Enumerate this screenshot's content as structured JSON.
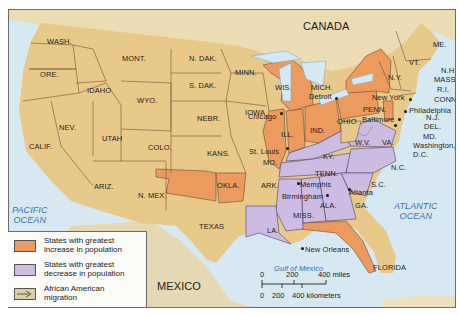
{
  "colors": {
    "water": "#d6e9f3",
    "land_neutral": "#e9c98a",
    "land_foreign": "#ecdcb4",
    "increase": "#ec9a5e",
    "decrease": "#cdbbe3",
    "border": "#5a4a3a",
    "ocean_label": "#3a6fae"
  },
  "regions": {
    "canada": "CANADA",
    "mexico": "MEXICO",
    "pacific": "PACIFIC\nOCEAN",
    "atlantic": "ATLANTIC\nOCEAN",
    "gulf": "Gulf of Mexico"
  },
  "states": {
    "wash": "WASH.",
    "ore": "ORE.",
    "calif": "CALIF.",
    "idaho": "IDAHO",
    "nev": "NEV.",
    "mont": "MONT.",
    "wyo": "WYO.",
    "utah": "UTAH",
    "ariz": "ARIZ.",
    "colo": "COLO.",
    "nmex": "N. MEX.",
    "ndak": "N. DAK.",
    "sdak": "S. DAK.",
    "nebr": "NEBR.",
    "kans": "KANS.",
    "okla": "OKLA.",
    "texas": "TEXAS",
    "minn": "MINN.",
    "iowa": "IOWA",
    "mo": "MO.",
    "ark": "ARK.",
    "la": "LA.",
    "wis": "WIS.",
    "ill": "ILL.",
    "mich": "MICH.",
    "ind": "IND.",
    "ohio": "OHIO",
    "ky": "KY.",
    "tenn": "TENN.",
    "miss": "MISS.",
    "ala": "ALA.",
    "ga": "GA.",
    "florida": "FLORIDA",
    "sc": "S.C.",
    "nc": "N.C.",
    "va": "VA.",
    "wv": "W.V.",
    "penn": "PENN.",
    "ny": "N.Y.",
    "vt": "VT.",
    "me": "ME.",
    "nh": "N.H.",
    "mass": "MASS.",
    "ri": "R.I.",
    "conn": "CONN.",
    "nj": "N.J.",
    "del": "DEL.",
    "md": "MD.",
    "dc": "Washington,\nD.C."
  },
  "cities": {
    "chicago": "Chicago",
    "detroit": "Detroit",
    "st_louis": "St. Louis",
    "new_york": "New York",
    "philadelphia": "Philadelphia",
    "baltimore": "Baltimore",
    "memphis": "Memphis",
    "birmingham": "Birmingham",
    "atlanta": "Atlanta",
    "new_orleans": "New Orleans"
  },
  "legend": {
    "items": [
      {
        "label": "States with greatest increase in population",
        "line1": "States with greatest",
        "line2": "increase in population",
        "color": "#ec9a5e"
      },
      {
        "label": "States with greatest decrease in population",
        "line1": "States with greatest",
        "line2": "decrease in population",
        "color": "#cdbbe3"
      },
      {
        "label": "African American migration",
        "line1": "African American",
        "line2": "migration",
        "color": "#d9cfa9"
      }
    ]
  },
  "scale": {
    "miles_ticks": [
      "0",
      "200",
      "400 miles"
    ],
    "km_ticks": [
      "0",
      "200",
      "400 kilometers"
    ]
  }
}
